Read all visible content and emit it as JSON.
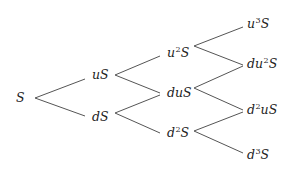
{
  "diagram": {
    "title": "",
    "type": "binomial-tree",
    "steps": 3,
    "edge_color": "#555555",
    "text_color": "#222222",
    "nodes": [
      {
        "id": "n0",
        "label": "S",
        "base": "S",
        "pre": "",
        "sup": "",
        "post": "",
        "x": 16,
        "y": 98
      },
      {
        "id": "n1u",
        "label": "uS",
        "pre": "uS",
        "sup": "",
        "post": "",
        "x": 92,
        "y": 75
      },
      {
        "id": "n1d",
        "label": "dS",
        "pre": "dS",
        "sup": "",
        "post": "",
        "x": 92,
        "y": 117
      },
      {
        "id": "n2uu",
        "label": "u^2S",
        "pre": "u",
        "sup": "2",
        "post": "S",
        "x": 167,
        "y": 53
      },
      {
        "id": "n2ud",
        "label": "duS",
        "pre": "duS",
        "sup": "",
        "post": "",
        "x": 167,
        "y": 93
      },
      {
        "id": "n2dd",
        "label": "d^2S",
        "pre": "d",
        "sup": "2",
        "post": "S",
        "x": 167,
        "y": 133
      },
      {
        "id": "n3uuu",
        "label": "u^3S",
        "pre": "u",
        "sup": "3",
        "post": "S",
        "x": 247,
        "y": 24
      },
      {
        "id": "n3uud",
        "label": "du^2S",
        "pre": "du",
        "sup": "2",
        "post": "S",
        "x": 247,
        "y": 64
      },
      {
        "id": "n3udd",
        "label": "d^2uS",
        "pre": "d",
        "sup": "2",
        "post": "uS",
        "x": 247,
        "y": 110
      },
      {
        "id": "n3ddd",
        "label": "d^3S",
        "pre": "d",
        "sup": "3",
        "post": "S",
        "x": 247,
        "y": 155
      }
    ],
    "edges": [
      {
        "from": "S",
        "to": "uS",
        "x1": 35,
        "y1": 98,
        "x2": 85,
        "y2": 79
      },
      {
        "from": "S",
        "to": "dS",
        "x1": 35,
        "y1": 98,
        "x2": 85,
        "y2": 116
      },
      {
        "from": "uS",
        "to": "u^2S",
        "x1": 115,
        "y1": 75,
        "x2": 160,
        "y2": 56
      },
      {
        "from": "uS",
        "to": "duS",
        "x1": 115,
        "y1": 75,
        "x2": 160,
        "y2": 93
      },
      {
        "from": "dS",
        "to": "duS",
        "x1": 115,
        "y1": 113,
        "x2": 160,
        "y2": 95
      },
      {
        "from": "dS",
        "to": "d^2S",
        "x1": 115,
        "y1": 113,
        "x2": 160,
        "y2": 133
      },
      {
        "from": "u^2S",
        "to": "u^3S",
        "x1": 194,
        "y1": 46,
        "x2": 243,
        "y2": 27
      },
      {
        "from": "u^2S",
        "to": "du^2S",
        "x1": 194,
        "y1": 46,
        "x2": 243,
        "y2": 65
      },
      {
        "from": "duS",
        "to": "du^2S",
        "x1": 194,
        "y1": 88,
        "x2": 243,
        "y2": 66
      },
      {
        "from": "duS",
        "to": "d^2uS",
        "x1": 194,
        "y1": 88,
        "x2": 243,
        "y2": 110
      },
      {
        "from": "d^2S",
        "to": "d^2uS",
        "x1": 194,
        "y1": 131,
        "x2": 243,
        "y2": 112
      },
      {
        "from": "d^2S",
        "to": "d^3S",
        "x1": 194,
        "y1": 131,
        "x2": 243,
        "y2": 153
      }
    ]
  }
}
